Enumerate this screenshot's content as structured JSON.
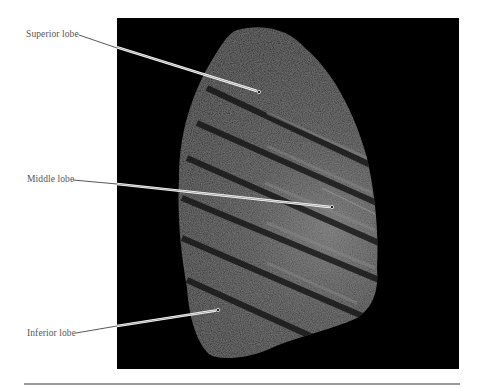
{
  "figure": {
    "labels": [
      {
        "text": "Superior lobe",
        "x": 26,
        "y": 30
      },
      {
        "text": "Middle lobe",
        "x": 27,
        "y": 175
      },
      {
        "text": "Inferior lobe",
        "x": 27,
        "y": 329
      }
    ],
    "colors": {
      "background": "#ffffff",
      "photo_background": "#000000",
      "label_text": "#555555",
      "rule": "#9a9a9a"
    }
  }
}
